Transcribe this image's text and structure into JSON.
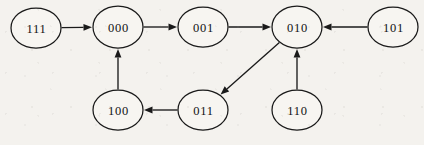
{
  "diagram": {
    "type": "directed-graph",
    "title": "",
    "background_color": "#f4f2ee",
    "node_fill_color": "#f7f5f1",
    "stroke_color": "#1a1a1a",
    "nodes": [
      {
        "id": "111",
        "label": "111",
        "cx": 36,
        "cy": 28,
        "rx": 25,
        "ry": 20
      },
      {
        "id": "000",
        "label": "000",
        "cx": 118,
        "cy": 27,
        "rx": 25,
        "ry": 21
      },
      {
        "id": "001",
        "label": "001",
        "cx": 203,
        "cy": 27,
        "rx": 25,
        "ry": 20
      },
      {
        "id": "010",
        "label": "010",
        "cx": 297,
        "cy": 27,
        "rx": 25,
        "ry": 21
      },
      {
        "id": "101",
        "label": "101",
        "cx": 393,
        "cy": 27,
        "rx": 25,
        "ry": 20
      },
      {
        "id": "100",
        "label": "100",
        "cx": 118,
        "cy": 110,
        "rx": 25,
        "ry": 20
      },
      {
        "id": "011",
        "label": "011",
        "cx": 203,
        "cy": 110,
        "rx": 25,
        "ry": 20
      },
      {
        "id": "110",
        "label": "110",
        "cx": 297,
        "cy": 110,
        "rx": 25,
        "ry": 20
      }
    ],
    "edges": [
      {
        "from": "111",
        "to": "000",
        "label": ""
      },
      {
        "from": "000",
        "to": "001",
        "label": ""
      },
      {
        "from": "001",
        "to": "010",
        "label": ""
      },
      {
        "from": "101",
        "to": "010",
        "label": ""
      },
      {
        "from": "100",
        "to": "000",
        "label": ""
      },
      {
        "from": "011",
        "to": "100",
        "label": ""
      },
      {
        "from": "010",
        "to": "011",
        "label": ""
      },
      {
        "from": "110",
        "to": "010",
        "label": ""
      }
    ]
  }
}
